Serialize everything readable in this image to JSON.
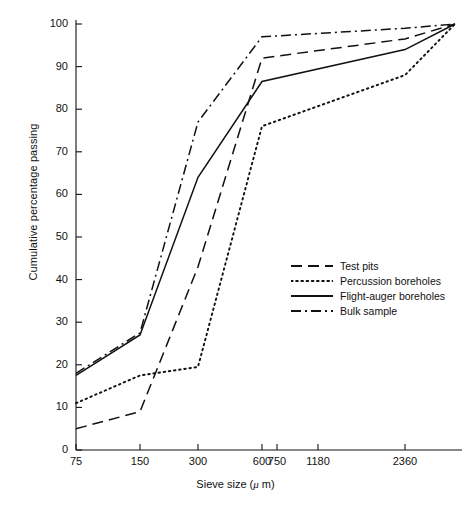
{
  "chart_data": {
    "type": "line",
    "title": "",
    "subtitle": "",
    "xlabel": "Sieve size (μ m)",
    "ylabel": "Cumulative percentage passing",
    "xscale": "log-sieve",
    "grid": false,
    "legend_position": "center-right",
    "xticks": [
      75,
      150,
      300,
      600,
      750,
      1180,
      2360
    ],
    "xtick_labels": [
      "75",
      "150",
      "300",
      "600",
      "750",
      "1180",
      "2360"
    ],
    "yticks": [
      0,
      10,
      20,
      30,
      40,
      50,
      60,
      70,
      80,
      90,
      100
    ],
    "ytick_labels": [
      "0",
      "10",
      "20",
      "30",
      "40",
      "50",
      "60",
      "70",
      "80",
      "90",
      "100"
    ],
    "ylim": [
      0,
      100
    ],
    "series": [
      {
        "name": "Test pits",
        "style": "dashed",
        "color": "#111111",
        "x": [
          75,
          150,
          300,
          600,
          2360,
          5000
        ],
        "values": [
          5,
          9,
          43,
          92,
          96.5,
          100
        ]
      },
      {
        "name": "Percussion boreholes",
        "style": "dotted",
        "color": "#111111",
        "x": [
          75,
          150,
          300,
          600,
          2360,
          5000
        ],
        "values": [
          11,
          17.5,
          19.5,
          76,
          88,
          100
        ]
      },
      {
        "name": "Flight-auger boreholes",
        "style": "solid",
        "color": "#111111",
        "x": [
          75,
          150,
          300,
          600,
          2360,
          5000
        ],
        "values": [
          17.5,
          27,
          64,
          86.5,
          94,
          100
        ]
      },
      {
        "name": "Bulk sample",
        "style": "dash-dot",
        "color": "#111111",
        "x": [
          75,
          150,
          300,
          600,
          2360,
          5000
        ],
        "values": [
          18,
          27.5,
          77,
          97,
          99,
          100
        ]
      }
    ]
  },
  "axis": {
    "ylabel": "Cumulative percentage passing",
    "xlabel_pre": "Sieve size (",
    "xlabel_mu": "μ",
    "xlabel_post": " m)"
  },
  "legend": {
    "items": [
      {
        "label": "Test pits",
        "style": "dashed"
      },
      {
        "label": "Percussion boreholes",
        "style": "dotted"
      },
      {
        "label": "Flight-auger boreholes",
        "style": "solid"
      },
      {
        "label": "Bulk sample",
        "style": "dash-dot"
      }
    ]
  }
}
